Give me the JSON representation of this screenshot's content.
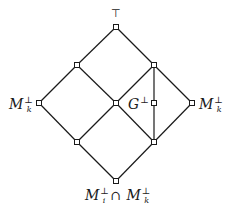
{
  "diagram": {
    "type": "lattice-hasse-diagram",
    "nodes": [
      {
        "id": "top",
        "x": 116,
        "y": 27,
        "label": "⊤"
      },
      {
        "id": "ul",
        "x": 77,
        "y": 65,
        "label": ""
      },
      {
        "id": "ur",
        "x": 154,
        "y": 65,
        "label": ""
      },
      {
        "id": "left",
        "x": 39,
        "y": 103,
        "label": "M_k^⊥"
      },
      {
        "id": "center",
        "x": 116,
        "y": 103,
        "label": ""
      },
      {
        "id": "g",
        "x": 154,
        "y": 103,
        "label": "G^⊥"
      },
      {
        "id": "right",
        "x": 192,
        "y": 103,
        "label": "M_k^⊥"
      },
      {
        "id": "ll",
        "x": 77,
        "y": 142,
        "label": ""
      },
      {
        "id": "lr",
        "x": 154,
        "y": 142,
        "label": ""
      },
      {
        "id": "bottom",
        "x": 116,
        "y": 181,
        "label": "M_i^⊥ ∩ M_k^⊥"
      }
    ],
    "edges": [
      [
        "top",
        "ul"
      ],
      [
        "top",
        "ur"
      ],
      [
        "ul",
        "left"
      ],
      [
        "ul",
        "center"
      ],
      [
        "ur",
        "center"
      ],
      [
        "ur",
        "right"
      ],
      [
        "ur",
        "g"
      ],
      [
        "left",
        "ll"
      ],
      [
        "center",
        "ll"
      ],
      [
        "center",
        "lr"
      ],
      [
        "g",
        "lr"
      ],
      [
        "right",
        "lr"
      ],
      [
        "ll",
        "bottom"
      ],
      [
        "lr",
        "bottom"
      ]
    ],
    "labels": {
      "top": "⊤",
      "left_main": "M",
      "left_sub": "k",
      "left_sup": "⊥",
      "right_main": "M",
      "right_sub": "k",
      "right_sup": "⊥",
      "g_main": "G",
      "g_sup": "⊥",
      "bottom_m1": "M",
      "bottom_sub1": "i",
      "bottom_sup1": "⊥",
      "bottom_cap": "∩",
      "bottom_m2": "M",
      "bottom_sub2": "k",
      "bottom_sup2": "⊥"
    },
    "colors": {
      "line": "#1a1a1a",
      "node_fill": "#ffffff"
    }
  }
}
